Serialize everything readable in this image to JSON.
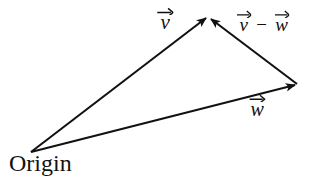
{
  "figure": {
    "background_color": "#ffffff",
    "stroke_color": "#111111",
    "width": 314,
    "height": 179
  },
  "labels": {
    "v": {
      "letter": "v",
      "has_overhead_arrow": true
    },
    "v_minus_w": {
      "left_letter": "v",
      "operator": "−",
      "right_letter": "w",
      "has_overhead_arrow": true
    },
    "w": {
      "letter": "w",
      "has_overhead_arrow": true
    },
    "origin": {
      "text": "Origin"
    }
  },
  "geometry": {
    "points": {
      "origin": {
        "x": 31,
        "y": 152
      },
      "apex": {
        "x": 208,
        "y": 16
      },
      "w_tip": {
        "x": 297,
        "y": 84
      }
    },
    "arrows": [
      {
        "name": "vector-v",
        "from": "origin",
        "to": "apex",
        "label": "v",
        "x1": 31,
        "y1": 152,
        "x2": 206,
        "y2": 18
      },
      {
        "name": "vector-v-minus-w",
        "from": "w_tip",
        "to": "apex",
        "label": "v − w",
        "x1": 297,
        "y1": 84,
        "x2": 211,
        "y2": 19
      },
      {
        "name": "vector-w",
        "from": "origin",
        "to": "w_tip",
        "label": "w",
        "x1": 31,
        "y1": 152,
        "x2": 295,
        "y2": 85
      }
    ]
  },
  "chart_data": {
    "type": "diagram",
    "subtype": "vector-triangle",
    "vertices": [
      {
        "name": "Origin",
        "x": 31,
        "y": 152
      },
      {
        "name": "head of v",
        "x": 208,
        "y": 16
      },
      {
        "name": "head of w",
        "x": 297,
        "y": 84
      }
    ],
    "vectors": [
      {
        "name": "v",
        "tail": "Origin",
        "head": "head of v",
        "components": [
          177,
          -136
        ]
      },
      {
        "name": "w",
        "tail": "Origin",
        "head": "head of w",
        "components": [
          266,
          -68
        ]
      },
      {
        "name": "v - w",
        "tail": "head of w",
        "head": "head of v",
        "components": [
          -89,
          -68
        ]
      }
    ],
    "annotations": [
      "Origin"
    ]
  }
}
